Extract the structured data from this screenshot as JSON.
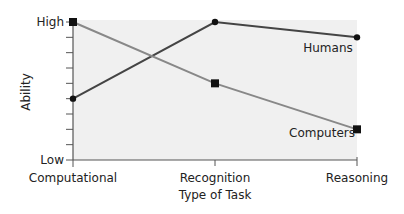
{
  "chart_data": {
    "type": "line",
    "title": "",
    "xlabel": "Type of Task",
    "ylabel": "Ability",
    "categories": [
      "Computational",
      "Recognition",
      "Reasoning"
    ],
    "y_tick_labels": {
      "top": "High",
      "bottom": "Low"
    },
    "ylim": [
      0,
      9
    ],
    "y_ticks_count": 10,
    "grid": false,
    "legend": "inline labels near line ends",
    "series": [
      {
        "name": "Humans",
        "values": [
          4,
          9,
          8
        ],
        "marker": "circle",
        "color": "#444444"
      },
      {
        "name": "Computers",
        "values": [
          9,
          5,
          2
        ],
        "marker": "square",
        "color": "#888888"
      }
    ]
  },
  "colors": {
    "plot_background": "#f0f0f0",
    "axis": "#555555",
    "marker": "#111111"
  }
}
